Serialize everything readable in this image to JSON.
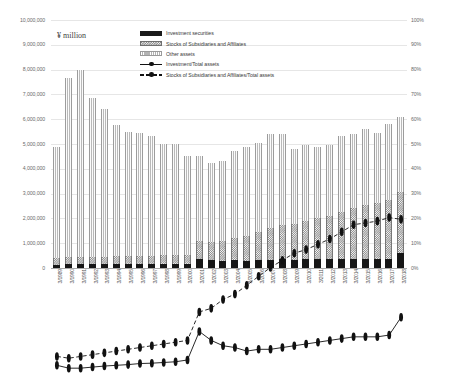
{
  "unit_label": "¥ million",
  "legend": [
    {
      "label": "Investment securities",
      "key": "bar-black"
    },
    {
      "label": "Stocks of Subsidiaries and Affiliates",
      "key": "bar-checker"
    },
    {
      "label": "Other assets",
      "key": "bar-vertical-hatch"
    },
    {
      "label": "Investment/Total assets",
      "key": "line-solid"
    },
    {
      "label": "Stocks of Subsidiaries and Affiliates/Total assets",
      "key": "line-dashed"
    }
  ],
  "chart_data": {
    "type": "bar",
    "title": "",
    "xlabel": "",
    "ylabel": "¥ million",
    "y2label": "%",
    "ylim": [
      0,
      10000000
    ],
    "y2lim": [
      0,
      100
    ],
    "grid": true,
    "legend_position": "top-center",
    "y_ticks": [
      "0",
      "1,000,000",
      "2,000,000",
      "3,000,000",
      "4,000,000",
      "5,000,000",
      "6,000,000",
      "7,000,000",
      "8,000,000",
      "9,000,000",
      "10,000,000"
    ],
    "y2_ticks": [
      "0%",
      "10%",
      "20%",
      "30%",
      "40%",
      "50%",
      "60%",
      "70%",
      "80%",
      "90%",
      "100%"
    ],
    "categories": [
      "3/1989",
      "3/1990",
      "3/1991",
      "3/1992",
      "3/1993",
      "3/1994",
      "3/1995",
      "3/1996",
      "3/1997",
      "3/1998",
      "3/1999",
      "3/2000",
      "3/2001",
      "3/2002",
      "3/2003",
      "3/2004",
      "3/2005",
      "3/2006",
      "3/2007",
      "3/2008",
      "3/2009",
      "3/2010",
      "3/2011",
      "3/2012",
      "3/2013",
      "3/2014",
      "3/2015",
      "3/2016",
      "3/2017",
      "3/2018"
    ],
    "series": [
      {
        "name": "Investment securities",
        "axis": "left",
        "stack": "assets",
        "values": [
          140000,
          150000,
          160000,
          150000,
          150000,
          150000,
          150000,
          150000,
          150000,
          150000,
          150000,
          150000,
          370000,
          320000,
          300000,
          330000,
          300000,
          310000,
          330000,
          350000,
          330000,
          360000,
          350000,
          360000,
          360000,
          370000,
          380000,
          370000,
          380000,
          600000
        ]
      },
      {
        "name": "Stocks of Subsidiaries and Affiliates",
        "axis": "left",
        "stack": "assets",
        "values": [
          260000,
          290000,
          300000,
          300000,
          310000,
          320000,
          330000,
          340000,
          350000,
          360000,
          370000,
          380000,
          700000,
          720000,
          780000,
          900000,
          1000000,
          1150000,
          1300000,
          1400000,
          1450000,
          1550000,
          1650000,
          1750000,
          1900000,
          2050000,
          2150000,
          2250000,
          2350000,
          2450000
        ]
      },
      {
        "name": "Other assets",
        "axis": "left",
        "stack": "assets",
        "values": [
          4500000,
          7210000,
          7540000,
          6400000,
          5940000,
          5280000,
          5000000,
          4950000,
          4820000,
          4490000,
          4480000,
          3970000,
          3430000,
          3180000,
          3220000,
          3470000,
          3600000,
          3570000,
          3770000,
          3650000,
          3020000,
          3040000,
          2900000,
          2840000,
          3080000,
          2990000,
          3070000,
          2840000,
          3070000,
          3050000
        ]
      },
      {
        "name": "Investment/Total assets",
        "axis": "right",
        "type": "line",
        "style": "solid",
        "values": [
          3.0,
          2.2,
          2.2,
          2.5,
          2.8,
          3.0,
          3.2,
          3.5,
          3.6,
          3.8,
          4.0,
          4.5,
          12.5,
          10.0,
          8.5,
          8.0,
          7.0,
          7.5,
          7.5,
          8.0,
          8.5,
          9.0,
          9.5,
          10.0,
          10.5,
          11.0,
          11.0,
          11.0,
          11.5,
          16.5
        ]
      },
      {
        "name": "Stocks of Subsidiaries and Affiliates/Total assets",
        "axis": "right",
        "type": "line",
        "style": "dashed",
        "values": [
          5.5,
          5.0,
          5.5,
          6.0,
          6.5,
          7.0,
          7.5,
          8.0,
          8.5,
          9.0,
          9.5,
          10.0,
          18.0,
          19.0,
          21.5,
          23.0,
          25.5,
          28.0,
          30.5,
          32.5,
          34.5,
          35.5,
          37.0,
          38.5,
          40.5,
          42.5,
          43.0,
          43.5,
          44.5,
          44.0
        ]
      }
    ]
  }
}
